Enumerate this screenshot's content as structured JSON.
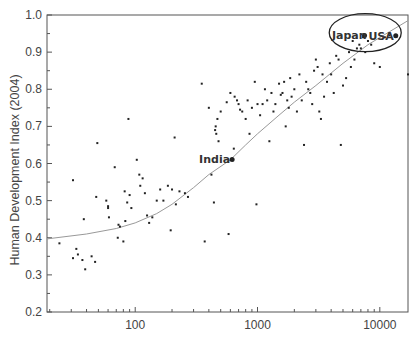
{
  "chart_data": {
    "type": "scatter",
    "title": "",
    "xlabel": "",
    "ylabel": "Human Development Index (2004)",
    "xscale": "log",
    "xlim": [
      19,
      17000
    ],
    "ylim": [
      0.2,
      1.0
    ],
    "grid": false,
    "legend": null,
    "x_ticks": [
      {
        "value": 100,
        "label": "100"
      },
      {
        "value": 1000,
        "label": "1000"
      },
      {
        "value": 10000,
        "label": "10000"
      }
    ],
    "y_ticks": [
      {
        "value": 0.2,
        "label": "0.2"
      },
      {
        "value": 0.3,
        "label": "0.3"
      },
      {
        "value": 0.4,
        "label": "0.4"
      },
      {
        "value": 0.5,
        "label": "0.5"
      },
      {
        "value": 0.6,
        "label": "0.6"
      },
      {
        "value": 0.7,
        "label": "0.7"
      },
      {
        "value": 0.8,
        "label": "0.8"
      },
      {
        "value": 0.9,
        "label": "0.9"
      },
      {
        "value": 1.0,
        "label": "1.0"
      }
    ],
    "series": [
      {
        "name": "countries",
        "points": [
          [
            24,
            0.385
          ],
          [
            31,
            0.555
          ],
          [
            31,
            0.345
          ],
          [
            33,
            0.37
          ],
          [
            34,
            0.355
          ],
          [
            37,
            0.34
          ],
          [
            38,
            0.45
          ],
          [
            39,
            0.315
          ],
          [
            44,
            0.35
          ],
          [
            47,
            0.335
          ],
          [
            48,
            0.51
          ],
          [
            49,
            0.655
          ],
          [
            58,
            0.5
          ],
          [
            60,
            0.485
          ],
          [
            60,
            0.48
          ],
          [
            61,
            0.455
          ],
          [
            68,
            0.59
          ],
          [
            72,
            0.4
          ],
          [
            73,
            0.435
          ],
          [
            75,
            0.43
          ],
          [
            80,
            0.39
          ],
          [
            82,
            0.525
          ],
          [
            83,
            0.445
          ],
          [
            86,
            0.495
          ],
          [
            88,
            0.72
          ],
          [
            90,
            0.515
          ],
          [
            93,
            0.48
          ],
          [
            103,
            0.61
          ],
          [
            108,
            0.57
          ],
          [
            110,
            0.54
          ],
          [
            115,
            0.56
          ],
          [
            120,
            0.52
          ],
          [
            125,
            0.46
          ],
          [
            130,
            0.44
          ],
          [
            138,
            0.455
          ],
          [
            150,
            0.5
          ],
          [
            160,
            0.53
          ],
          [
            170,
            0.5
          ],
          [
            185,
            0.54
          ],
          [
            195,
            0.42
          ],
          [
            200,
            0.53
          ],
          [
            210,
            0.67
          ],
          [
            215,
            0.49
          ],
          [
            230,
            0.525
          ],
          [
            255,
            0.52
          ],
          [
            270,
            0.51
          ],
          [
            350,
            0.815
          ],
          [
            370,
            0.39
          ],
          [
            400,
            0.75
          ],
          [
            420,
            0.57
          ],
          [
            440,
            0.495
          ],
          [
            450,
            0.69
          ],
          [
            455,
            0.7
          ],
          [
            460,
            0.68
          ],
          [
            470,
            0.72
          ],
          [
            480,
            0.66
          ],
          [
            500,
            0.74
          ],
          [
            560,
            0.765
          ],
          [
            580,
            0.41
          ],
          [
            600,
            0.79
          ],
          [
            620,
            0.61
          ],
          [
            640,
            0.64
          ],
          [
            650,
            0.78
          ],
          [
            680,
            0.77
          ],
          [
            700,
            0.76
          ],
          [
            720,
            0.745
          ],
          [
            750,
            0.74
          ],
          [
            800,
            0.72
          ],
          [
            830,
            0.77
          ],
          [
            860,
            0.68
          ],
          [
            900,
            0.75
          ],
          [
            950,
            0.82
          ],
          [
            980,
            0.49
          ],
          [
            1000,
            0.76
          ],
          [
            1050,
            0.73
          ],
          [
            1100,
            0.76
          ],
          [
            1150,
            0.8
          ],
          [
            1200,
            0.77
          ],
          [
            1250,
            0.66
          ],
          [
            1300,
            0.79
          ],
          [
            1350,
            0.74
          ],
          [
            1400,
            0.76
          ],
          [
            1500,
            0.815
          ],
          [
            1550,
            0.785
          ],
          [
            1600,
            0.79
          ],
          [
            1650,
            0.82
          ],
          [
            1700,
            0.7
          ],
          [
            1750,
            0.77
          ],
          [
            1800,
            0.75
          ],
          [
            1850,
            0.83
          ],
          [
            1900,
            0.78
          ],
          [
            2000,
            0.8
          ],
          [
            2100,
            0.74
          ],
          [
            2200,
            0.84
          ],
          [
            2300,
            0.77
          ],
          [
            2400,
            0.65
          ],
          [
            2500,
            0.82
          ],
          [
            2600,
            0.8
          ],
          [
            2700,
            0.79
          ],
          [
            2800,
            0.76
          ],
          [
            2900,
            0.85
          ],
          [
            3000,
            0.88
          ],
          [
            3100,
            0.86
          ],
          [
            3200,
            0.74
          ],
          [
            3300,
            0.72
          ],
          [
            3400,
            0.84
          ],
          [
            3500,
            0.78
          ],
          [
            3700,
            0.82
          ],
          [
            3900,
            0.87
          ],
          [
            4000,
            0.84
          ],
          [
            4200,
            0.79
          ],
          [
            4400,
            0.89
          ],
          [
            4600,
            0.88
          ],
          [
            4800,
            0.65
          ],
          [
            5000,
            0.81
          ],
          [
            5300,
            0.83
          ],
          [
            5600,
            0.9
          ],
          [
            5800,
            0.86
          ],
          [
            6000,
            0.93
          ],
          [
            6200,
            0.88
          ],
          [
            6500,
            0.91
          ],
          [
            6800,
            0.92
          ],
          [
            7000,
            0.91
          ],
          [
            7300,
            0.94
          ],
          [
            7600,
            0.9
          ],
          [
            8000,
            0.93
          ],
          [
            8500,
            0.92
          ],
          [
            9000,
            0.87
          ],
          [
            10000,
            0.86
          ],
          [
            11000,
            0.94
          ],
          [
            12000,
            0.945
          ],
          [
            17000,
            0.84
          ]
        ]
      }
    ],
    "annotations": [
      {
        "label": "India",
        "x": 620,
        "y": 0.611
      },
      {
        "label": "Japan",
        "x": 7500,
        "y": 0.945
      },
      {
        "label": "USA",
        "x": 13500,
        "y": 0.944
      }
    ],
    "trend_curve": {
      "type": "logistic-like fit",
      "points": [
        [
          19,
          0.397
        ],
        [
          40,
          0.41
        ],
        [
          70,
          0.425
        ],
        [
          100,
          0.44
        ],
        [
          150,
          0.465
        ],
        [
          200,
          0.49
        ],
        [
          300,
          0.535
        ],
        [
          400,
          0.57
        ],
        [
          600,
          0.61
        ],
        [
          800,
          0.65
        ],
        [
          1000,
          0.68
        ],
        [
          1500,
          0.73
        ],
        [
          2000,
          0.765
        ],
        [
          3000,
          0.81
        ],
        [
          5000,
          0.87
        ],
        [
          8000,
          0.92
        ],
        [
          12000,
          0.955
        ],
        [
          17000,
          0.985
        ]
      ]
    },
    "highlight_ellipse": {
      "cx": 7600,
      "cy": 0.947,
      "label": "circled region: Japan, USA"
    }
  }
}
